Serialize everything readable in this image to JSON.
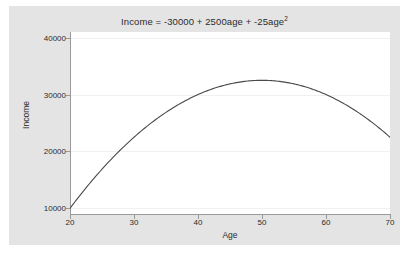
{
  "chart_data": {
    "type": "line",
    "title": "Income = -30000 + 2500age + -25age",
    "title_exponent": "2",
    "xlabel": "Age",
    "ylabel": "Income",
    "xlim": [
      20,
      70
    ],
    "ylim": [
      9000,
      41000
    ],
    "xticks": [
      20,
      30,
      40,
      50,
      60,
      70
    ],
    "xtick_labels": [
      "20",
      "30",
      "40",
      "50",
      "60",
      "70"
    ],
    "yticks": [
      10000,
      20000,
      30000,
      40000
    ],
    "ytick_labels": [
      "10000",
      "20000",
      "30000",
      "40000"
    ],
    "grid": true,
    "grid_axis": "y",
    "legend": null,
    "equation": {
      "intercept": -30000,
      "linear_coefficient": 2500,
      "quadratic_coefficient": -25,
      "variable": "age"
    },
    "series": [
      {
        "name": "Income",
        "color": "#4a4a4a",
        "x": [
          20,
          22,
          24,
          26,
          28,
          30,
          32,
          34,
          36,
          38,
          40,
          42,
          44,
          46,
          48,
          50,
          52,
          54,
          56,
          58,
          60,
          62,
          64,
          66,
          68,
          70
        ],
        "values": [
          10000,
          12900,
          15600,
          18100,
          20400,
          22500,
          24400,
          26100,
          27600,
          28900,
          30000,
          30900,
          31600,
          32100,
          32400,
          32500,
          32400,
          32100,
          31600,
          30900,
          30000,
          28900,
          27600,
          26100,
          24400,
          22500
        ]
      }
    ],
    "annotations": {
      "vertex_age": 50,
      "vertex_income": 32500
    }
  },
  "figure": {
    "background_color": "#e4e4e4",
    "plot_background_color": "#ffffff",
    "axis_color": "#9a9a9a",
    "gridline_color": "#f0f0f0",
    "text_color": "#2b2b2b"
  }
}
